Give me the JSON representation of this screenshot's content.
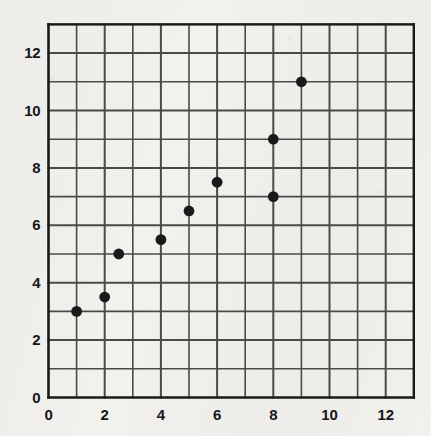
{
  "chart_data": {
    "type": "scatter",
    "title": "",
    "subtitle": "",
    "xlabel": "",
    "ylabel": "",
    "xlim": [
      0,
      13
    ],
    "ylim": [
      0,
      13
    ],
    "grid": true,
    "grid_step": 1,
    "legend": "none",
    "x_ticks": [
      {
        "value": 0,
        "label": "0"
      },
      {
        "value": 2,
        "label": "2"
      },
      {
        "value": 4,
        "label": "4"
      },
      {
        "value": 6,
        "label": "6"
      },
      {
        "value": 8,
        "label": "8"
      },
      {
        "value": 10,
        "label": "10"
      },
      {
        "value": 12,
        "label": "12"
      }
    ],
    "y_ticks": [
      {
        "value": 0,
        "label": "0"
      },
      {
        "value": 2,
        "label": "2"
      },
      {
        "value": 4,
        "label": "4"
      },
      {
        "value": 6,
        "label": "6"
      },
      {
        "value": 8,
        "label": "8"
      },
      {
        "value": 10,
        "label": "10"
      },
      {
        "value": 12,
        "label": "12"
      }
    ],
    "series": [
      {
        "name": "data",
        "marker": "filled-circle",
        "color": "#1a1a1a",
        "points": [
          {
            "x": 1,
            "y": 3
          },
          {
            "x": 2,
            "y": 3.5
          },
          {
            "x": 2.5,
            "y": 5
          },
          {
            "x": 4,
            "y": 5.5
          },
          {
            "x": 5,
            "y": 6.5
          },
          {
            "x": 6,
            "y": 7.5
          },
          {
            "x": 8,
            "y": 7
          },
          {
            "x": 8,
            "y": 9
          },
          {
            "x": 9,
            "y": 11
          }
        ]
      }
    ],
    "colors": {
      "marker": "#1a1a1a",
      "grid": "#4a4a4a",
      "axis": "#1a1a1a",
      "background": "#f2f1ee",
      "text": "#16161a"
    }
  }
}
